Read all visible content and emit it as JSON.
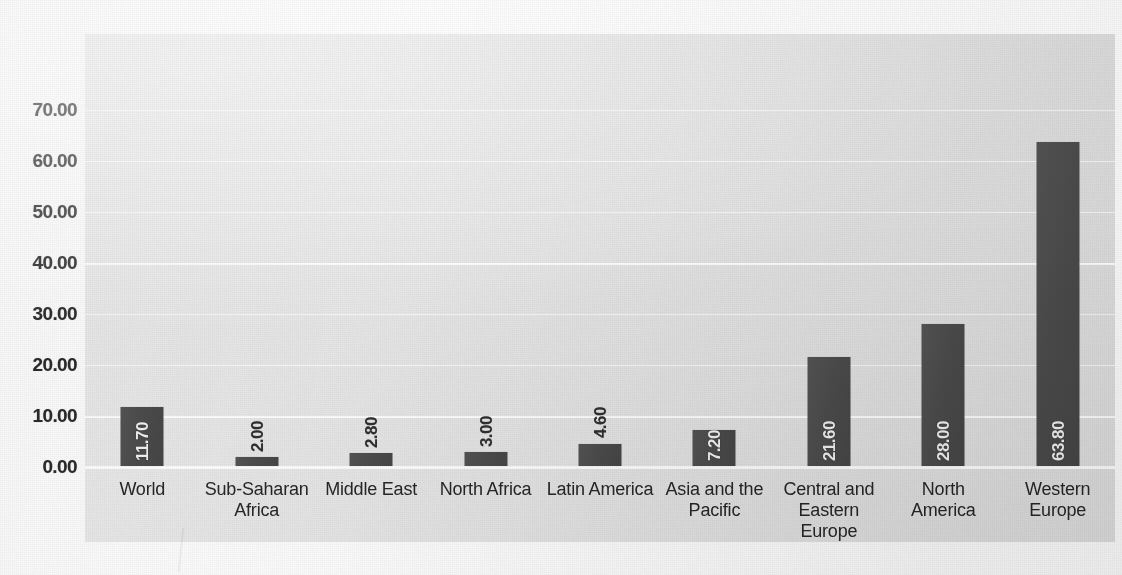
{
  "chart_data": {
    "type": "bar",
    "title": "",
    "subtitle": "",
    "xlabel": "",
    "ylabel": "",
    "categories": [
      "World",
      "Sub-Saharan Africa",
      "Middle East",
      "North Africa",
      "Latin America",
      "Asia and the Pacific",
      "Central and Eastern Europe",
      "North America",
      "Western Europe"
    ],
    "category_lines": [
      [
        "World"
      ],
      [
        "Sub-Saharan",
        "Africa"
      ],
      [
        "Middle East"
      ],
      [
        "North Africa"
      ],
      [
        "Latin America"
      ],
      [
        "Asia and the",
        "Pacific"
      ],
      [
        "Central and",
        "Eastern Europe"
      ],
      [
        "North America"
      ],
      [
        "Western",
        "Europe"
      ]
    ],
    "values": [
      11.7,
      2.0,
      2.8,
      3.0,
      4.6,
      7.2,
      21.6,
      28.0,
      63.8
    ],
    "value_labels": [
      "11.70",
      "2.00",
      "2.80",
      "3.00",
      "4.60",
      "7.20",
      "21.60",
      "28.00",
      "63.80"
    ],
    "label_placement": [
      "inside",
      "outside",
      "outside",
      "outside",
      "outside",
      "inside",
      "inside",
      "inside",
      "inside"
    ],
    "label_rotation_deg": 90,
    "ylim": [
      0,
      70
    ],
    "ytick_values": [
      0,
      10,
      20,
      30,
      40,
      50,
      60,
      70
    ],
    "ytick_labels": [
      "0.00",
      "10.00",
      "20.00",
      "30.00",
      "40.00",
      "50.00",
      "60.00",
      "70.00"
    ],
    "grid": "horizontal-white",
    "legend": "none",
    "bar_color": "#4d4d4d",
    "plot_background": "#e4e4e4",
    "page_background": "#fcfcfc",
    "gridline_color": "#ffffff",
    "axis_text_color": "#2b2b2b",
    "inside_label_color": "#f2f2f2",
    "outside_label_color": "#2f2f2f"
  }
}
